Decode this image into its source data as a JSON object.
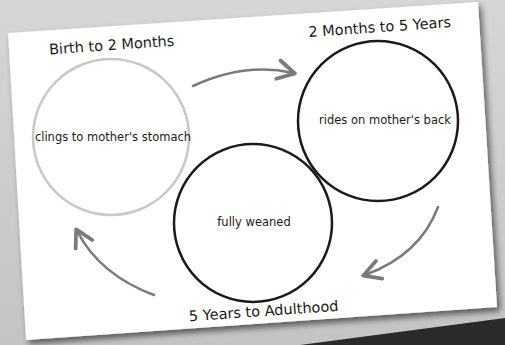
{
  "diagram": {
    "type": "cycle",
    "stages": [
      {
        "id": "stage-1",
        "title": "Birth to 2 Months",
        "description": "clings to mother's stomach",
        "circle_color": "#c8c8c8"
      },
      {
        "id": "stage-2",
        "title": "2 Months to 5 Years",
        "description": "rides on mother's back",
        "circle_color": "#1a1a1a"
      },
      {
        "id": "stage-3",
        "title": "5 Years to Adulthood",
        "description": "fully weaned",
        "circle_color": "#1a1a1a"
      }
    ],
    "arrows": [
      {
        "from": "stage-1",
        "to": "stage-2"
      },
      {
        "from": "stage-2",
        "to": "stage-3"
      },
      {
        "from": "stage-3",
        "to": "stage-1"
      }
    ],
    "colors": {
      "background": "#cfcfcf",
      "paper": "#ffffff",
      "arrow": "#7a7a7a",
      "text": "#1a1a1a"
    }
  }
}
